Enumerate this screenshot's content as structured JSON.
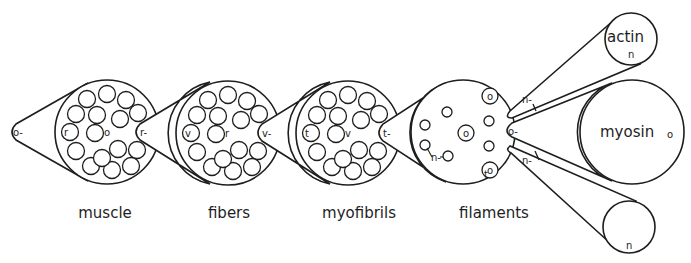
{
  "diagram": {
    "captions": [
      "muscle",
      "fibers",
      "myofibrils",
      "filaments"
    ],
    "levels": [
      {
        "name": "muscle",
        "center_label": "o",
        "edge_label": "r",
        "outgoing_label": "r-",
        "incoming_label": "o-"
      },
      {
        "name": "fibers",
        "center_label": "r",
        "edge_label": "v",
        "outgoing_label": "v-"
      },
      {
        "name": "myofibrils",
        "center_label": "v",
        "edge_label": "t",
        "outgoing_label": "t-"
      },
      {
        "name": "filaments",
        "center_label": "",
        "edge_label": "t",
        "inner_labels": [
          "o",
          "o",
          "o"
        ],
        "filament_label": "n-",
        "thick_label": "o-",
        "thin_labels": [
          "n-",
          "n-"
        ]
      }
    ],
    "components": [
      {
        "name": "actin",
        "label": "actin",
        "sub_label": "n"
      },
      {
        "name": "myosin",
        "label": "myosin",
        "sub_label": "o"
      },
      {
        "name": "unlabeled-filament",
        "label": "",
        "sub_label": "n"
      }
    ]
  }
}
